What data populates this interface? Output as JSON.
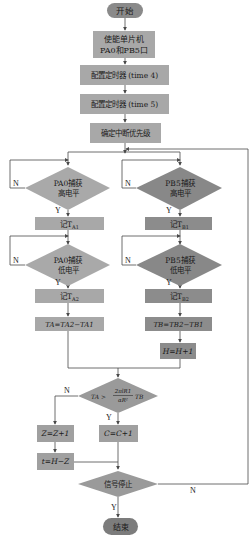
{
  "flowchart": {
    "colors": {
      "terminal": "#8a8a8a",
      "process_light": "#a8a8a8",
      "process_dark": "#8c8c8c",
      "decision_light": "#a9a9a9",
      "decision_dark": "#888888",
      "line": "#4a4a4a"
    },
    "start": "开始",
    "end": "结束",
    "init": {
      "enable_line1": "使能单片机",
      "enable_line2": "PA0和PB5口",
      "timer4": "配置定时器 (time 4)",
      "timer5": "配置定时器 (time 5)",
      "priority": "确定中断优先级"
    },
    "branch_a": {
      "capture_high_line1": "PA0捕获",
      "capture_high_line2": "高电平",
      "record_1": "记T",
      "record_1_sub": "A1",
      "capture_low_line1": "PA0捕获",
      "capture_low_line2": "低电平",
      "record_2": "记T",
      "record_2_sub": "A2",
      "formula": "TA=TA2−TA1"
    },
    "branch_b": {
      "capture_high_line1": "PB5捕获",
      "capture_high_line2": "高电平",
      "record_1": "记T",
      "record_1_sub": "B1",
      "capture_low_line1": "PB5捕获",
      "capture_low_line2": "低电平",
      "record_2": "记T",
      "record_2_sub": "B2",
      "formula": "TB=TB2−TB1",
      "counter": "H=H+1"
    },
    "compare": {
      "lhs": "TA >",
      "numerator": "2πlR1",
      "denominator": "αR²",
      "rhs": "TB"
    },
    "no_branch": {
      "counter": "Z=Z+1",
      "result": "t=H−Z"
    },
    "yes_branch": {
      "counter": "C=C+1"
    },
    "stop_check": "信号停止",
    "labels": {
      "yes": "Y",
      "no": "N"
    }
  }
}
